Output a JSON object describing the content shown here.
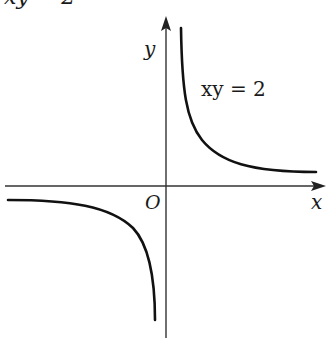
{
  "diagram": {
    "title_fragment": "xy = 2",
    "equation_label": "xy = 2",
    "axes": {
      "x_label": "x",
      "y_label": "y",
      "origin_label": "O"
    },
    "curve": {
      "equation": "xy = 2",
      "type": "hyperbola",
      "branches": [
        "first-quadrant",
        "third-quadrant"
      ]
    },
    "colors": {
      "curve": "#111111",
      "axis": "#333333",
      "background": "#ffffff"
    }
  }
}
